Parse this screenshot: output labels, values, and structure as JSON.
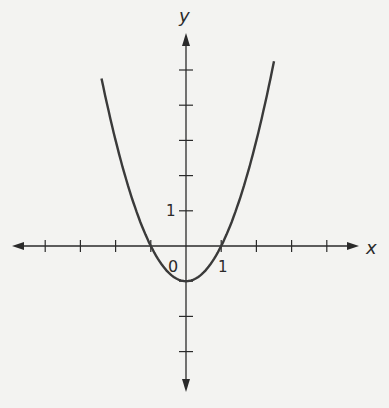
{
  "chart_data": {
    "type": "line",
    "title": "",
    "xlabel": "x",
    "ylabel": "y",
    "function": "y = x^2 - 1",
    "series": [
      {
        "name": "parabola",
        "x": [
          -2.4,
          -2,
          -1.5,
          -1,
          -0.5,
          0,
          0.5,
          1,
          1.5,
          2,
          2.5
        ],
        "values": [
          4.76,
          3,
          1.25,
          0,
          -0.75,
          -1,
          -0.75,
          0,
          1.25,
          3,
          5.25
        ]
      }
    ],
    "x_ticks": [
      -4,
      -3,
      -2,
      -1,
      0,
      1,
      2,
      3,
      4
    ],
    "y_ticks": [
      -3,
      -2,
      -1,
      1,
      2,
      3,
      4,
      5
    ],
    "tick_labels": {
      "origin": "0",
      "x_one": "1",
      "y_one": "1"
    },
    "xlim": [
      -4.9,
      4.9
    ],
    "ylim": [
      -4.0,
      6.0
    ],
    "grid": false,
    "colors": {
      "curve": "#3a3a3a",
      "axis": "#2a2a2a",
      "background": "#f3f3f1"
    }
  },
  "labels": {
    "x_axis": "x",
    "y_axis": "y",
    "origin": "0",
    "x_unit": "1",
    "y_unit": "1"
  }
}
